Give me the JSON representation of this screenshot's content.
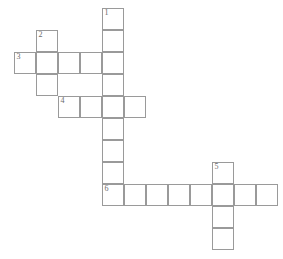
{
  "puzzle": {
    "title": "Crossword puzzle grid",
    "cell_size": 22,
    "grid_origin": {
      "x": 14,
      "y": 8
    },
    "colors": {
      "background": "#ffffff",
      "cell_fill": "#ffffff",
      "cell_border": "#9a9a9a",
      "number_text": "#6b6b6b"
    },
    "entry_numbers": [
      "1",
      "2",
      "3",
      "4",
      "5",
      "6"
    ],
    "entries": [
      {
        "number": "1",
        "direction": "down",
        "length": 9,
        "start_col": 4,
        "start_row": 0
      },
      {
        "number": "2",
        "direction": "down",
        "length": 3,
        "start_col": 1,
        "start_row": 1
      },
      {
        "number": "3",
        "direction": "across",
        "length": 5,
        "start_col": 0,
        "start_row": 2
      },
      {
        "number": "4",
        "direction": "across",
        "length": 4,
        "start_col": 2,
        "start_row": 4
      },
      {
        "number": "5",
        "direction": "down",
        "length": 4,
        "start_col": 9,
        "start_row": 7
      },
      {
        "number": "6",
        "direction": "across",
        "length": 8,
        "start_col": 4,
        "start_row": 8
      }
    ],
    "cells": [
      {
        "id": "c-r0-c4",
        "col": 4,
        "row": 0,
        "number": "1"
      },
      {
        "id": "c-r1-c4",
        "col": 4,
        "row": 1,
        "number": ""
      },
      {
        "id": "c-r1-c1",
        "col": 1,
        "row": 1,
        "number": "2"
      },
      {
        "id": "c-r2-c0",
        "col": 0,
        "row": 2,
        "number": "3"
      },
      {
        "id": "c-r2-c1",
        "col": 1,
        "row": 2,
        "number": ""
      },
      {
        "id": "c-r2-c2",
        "col": 2,
        "row": 2,
        "number": ""
      },
      {
        "id": "c-r2-c3",
        "col": 3,
        "row": 2,
        "number": ""
      },
      {
        "id": "c-r2-c4",
        "col": 4,
        "row": 2,
        "number": ""
      },
      {
        "id": "c-r3-c1",
        "col": 1,
        "row": 3,
        "number": ""
      },
      {
        "id": "c-r3-c4",
        "col": 4,
        "row": 3,
        "number": ""
      },
      {
        "id": "c-r4-c2",
        "col": 2,
        "row": 4,
        "number": "4"
      },
      {
        "id": "c-r4-c3",
        "col": 3,
        "row": 4,
        "number": ""
      },
      {
        "id": "c-r4-c4",
        "col": 4,
        "row": 4,
        "number": ""
      },
      {
        "id": "c-r4-c5",
        "col": 5,
        "row": 4,
        "number": ""
      },
      {
        "id": "c-r5-c4",
        "col": 4,
        "row": 5,
        "number": ""
      },
      {
        "id": "c-r6-c4",
        "col": 4,
        "row": 6,
        "number": ""
      },
      {
        "id": "c-r7-c4",
        "col": 4,
        "row": 7,
        "number": ""
      },
      {
        "id": "c-r7-c9",
        "col": 9,
        "row": 7,
        "number": "5"
      },
      {
        "id": "c-r8-c4",
        "col": 4,
        "row": 8,
        "number": "6"
      },
      {
        "id": "c-r8-c5",
        "col": 5,
        "row": 8,
        "number": ""
      },
      {
        "id": "c-r8-c6",
        "col": 6,
        "row": 8,
        "number": ""
      },
      {
        "id": "c-r8-c7",
        "col": 7,
        "row": 8,
        "number": ""
      },
      {
        "id": "c-r8-c8",
        "col": 8,
        "row": 8,
        "number": ""
      },
      {
        "id": "c-r8-c9",
        "col": 9,
        "row": 8,
        "number": ""
      },
      {
        "id": "c-r8-c10",
        "col": 10,
        "row": 8,
        "number": ""
      },
      {
        "id": "c-r8-c11",
        "col": 11,
        "row": 8,
        "number": ""
      },
      {
        "id": "c-r9-c9",
        "col": 9,
        "row": 9,
        "number": ""
      },
      {
        "id": "c-r10-c9",
        "col": 9,
        "row": 10,
        "number": ""
      }
    ]
  }
}
